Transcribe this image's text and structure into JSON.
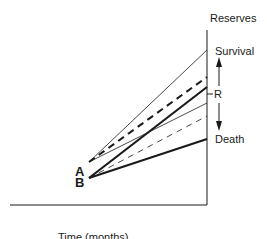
{
  "diagram": {
    "axis_label_y": "Reserves",
    "axis_label_x": "Time (months)",
    "outcome_top": "Survival",
    "outcome_bottom": "Death",
    "threshold_label": "R",
    "points": [
      {
        "id": "A",
        "label": "A"
      },
      {
        "id": "B",
        "label": "B"
      }
    ],
    "lines": [
      {
        "from": "A",
        "style": "thin-solid",
        "end": "Survival level"
      },
      {
        "from": "A",
        "style": "thick-dashed",
        "end": "above R"
      },
      {
        "from": "A",
        "style": "thin-solid",
        "end": "below R"
      },
      {
        "from": "B",
        "style": "thick-solid",
        "end": "near R"
      },
      {
        "from": "B",
        "style": "thin-dashed",
        "end": "below R"
      },
      {
        "from": "B",
        "style": "thick-solid",
        "end": "Death level"
      }
    ],
    "colors": {
      "ink": "#1a1a1a",
      "background": "#ffffff"
    }
  }
}
